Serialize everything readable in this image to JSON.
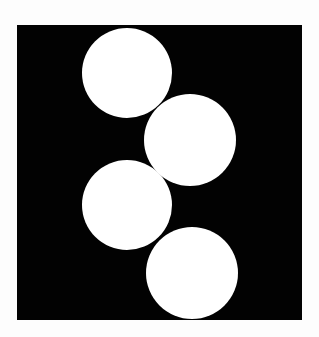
{
  "figure": {
    "background_color": "#fdfdfd",
    "square": {
      "x": 17,
      "y": 25,
      "width": 285,
      "height": 295,
      "fill": "#020202"
    },
    "circle_fill": "#ffffff",
    "circles": [
      {
        "cx": 127,
        "cy": 73,
        "r": 45
      },
      {
        "cx": 190,
        "cy": 140,
        "r": 46
      },
      {
        "cx": 127,
        "cy": 205,
        "r": 45
      },
      {
        "cx": 192,
        "cy": 273,
        "r": 46
      }
    ]
  }
}
